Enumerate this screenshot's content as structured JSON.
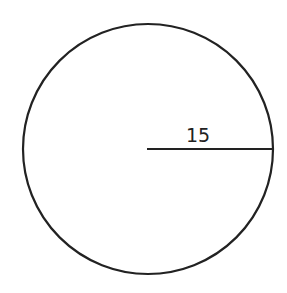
{
  "diagram": {
    "shape": "circle",
    "radius_label": "15",
    "stroke_color": "#222222",
    "background": "#ffffff"
  }
}
